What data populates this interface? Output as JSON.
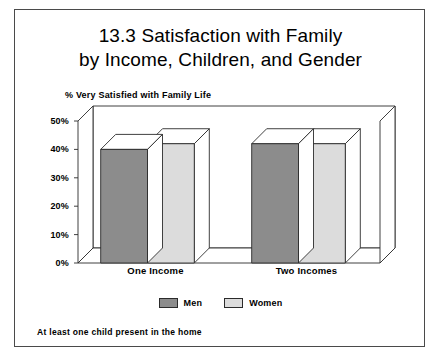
{
  "figure": {
    "title_line1": "13.3    Satisfaction with Family",
    "title_line2": "by Income, Children, and Gender",
    "footnote": "At least one child present in the home"
  },
  "chart_data": {
    "type": "bar",
    "title": "13.3    Satisfaction with Family by Income, Children, and Gender",
    "subtitle": "",
    "ylabel": "% Very Satisfied with Family Life",
    "xlabel": "",
    "categories": [
      "One Income",
      "Two Incomes"
    ],
    "series": [
      {
        "name": "Men",
        "color": "#8c8c8c",
        "values": [
          40,
          42
        ]
      },
      {
        "name": "Women",
        "color": "#dcdcdc",
        "values": [
          42,
          42
        ]
      }
    ],
    "ylim": [
      0,
      50
    ],
    "ytick_values": [
      0,
      10,
      20,
      30,
      40,
      50
    ],
    "ytick_labels": [
      "0%",
      "10%",
      "20%",
      "30%",
      "40%",
      "50%"
    ],
    "grid": false,
    "legend_position": "bottom-center",
    "three_d": true,
    "annotations": [
      "At least one child present in the home"
    ]
  },
  "colors": {
    "men_fill": "#8c8c8c",
    "women_fill": "#dcdcdc",
    "outline": "#2b2b2b",
    "frame": "#4a4a4a",
    "wall": "#ffffff"
  }
}
